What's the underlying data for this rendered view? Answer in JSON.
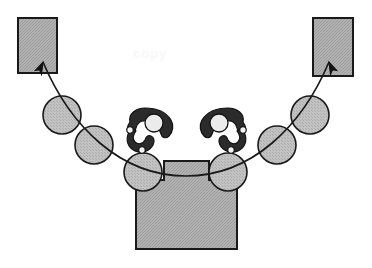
{
  "figure": {
    "background_color": "#ffffff",
    "width": 372,
    "height": 268,
    "watermark": {
      "text": "copy",
      "color": "#fafafa"
    }
  },
  "palette": {
    "fill_gray": "#a9a9a9",
    "sphere_gray": "#b8b8b8",
    "claw_dark": "#2b2b2b",
    "outline": "#1a1a1a",
    "highlight": "#efefef",
    "background": "#ffffff"
  },
  "bins": [
    {
      "name": "left-target-bin",
      "label": "",
      "x": 18,
      "y": 18,
      "width": 39,
      "height": 55,
      "fill": "#a9a9a9"
    },
    {
      "name": "right-target-bin",
      "label": "",
      "x": 313,
      "y": 18,
      "width": 40,
      "height": 58,
      "fill": "#a9a9a9"
    }
  ],
  "body": {
    "name": "central-body",
    "label": "",
    "fill": "#a9a9a9",
    "points": "164,161 209,161 209,180 237,180 237,249 136,249 136,180 164,180"
  },
  "claws": [
    {
      "name": "left-gripper-claw",
      "label": "",
      "fill": "#2b2b2b",
      "center_x": 150,
      "center_y": 126,
      "flip": false
    },
    {
      "name": "right-gripper-claw",
      "label": "",
      "fill": "#2b2b2b",
      "center_x": 223,
      "center_y": 126,
      "flip": true
    }
  ],
  "spheres": [
    {
      "name": "sphere-1",
      "label": "",
      "cx": 62,
      "cy": 115,
      "r": 19,
      "fill": "#b8b8b8"
    },
    {
      "name": "sphere-2",
      "label": "",
      "cx": 94,
      "cy": 145,
      "r": 19,
      "fill": "#b8b8b8"
    },
    {
      "name": "sphere-3",
      "label": "",
      "cx": 143,
      "cy": 172,
      "r": 19,
      "fill": "#b8b8b8"
    },
    {
      "name": "sphere-4",
      "label": "",
      "cx": 228,
      "cy": 172,
      "r": 19,
      "fill": "#b8b8b8"
    },
    {
      "name": "sphere-5",
      "label": "",
      "cx": 277,
      "cy": 145,
      "r": 19,
      "fill": "#b8b8b8"
    },
    {
      "name": "sphere-6",
      "label": "",
      "cx": 310,
      "cy": 115,
      "r": 19,
      "fill": "#b8b8b8"
    }
  ],
  "trajectory": {
    "name": "trajectory-curve",
    "label": "",
    "stroke": "#1a1a1a",
    "path": "M 43 62 C 70 126, 120 176, 186 176 C 252 176, 302 126, 329 62",
    "arrowheads": [
      {
        "name": "left-trajectory-arrowhead",
        "x": 43,
        "y": 62,
        "angle": 295
      },
      {
        "name": "right-trajectory-arrowhead",
        "x": 329,
        "y": 62,
        "angle": 245
      }
    ]
  }
}
